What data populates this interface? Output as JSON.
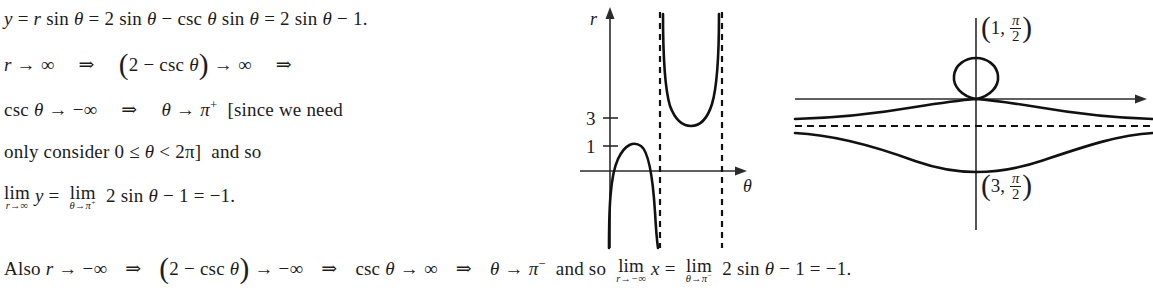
{
  "document": {
    "type": "math-solution",
    "background_color": "#ffffff",
    "text_color": "#1c1c1c"
  },
  "text_lines": [
    {
      "id": "line1",
      "content": "y = r sin θ = 2 sin θ − csc θ sin θ = 2 sin θ − 1.",
      "parts": {
        "y": "y",
        "eq1": "=",
        "r": "r",
        "sin1": "sin",
        "theta1": "θ",
        "eq2": "=",
        "two1": "2",
        "sin2": "sin",
        "theta2": "θ",
        "minus1": "−",
        "csc1": "csc",
        "theta3": "θ",
        "sin3": "sin",
        "theta4": "θ",
        "eq3": "=",
        "two2": "2",
        "sin4": "sin",
        "theta5": "θ",
        "minus2": "−",
        "one": "1."
      }
    },
    {
      "id": "line2",
      "content": "r → ∞ ⇒ (2 − csc θ) → ∞ ⇒",
      "parts": {
        "r": "r",
        "arrow1": "→",
        "inf1": "∞",
        "implies1": "⇒",
        "lparen": "(",
        "two": "2",
        "minus": "−",
        "csc": "csc",
        "theta": "θ",
        "rparen": ")",
        "arrow2": "→",
        "inf2": "∞",
        "implies2": "⇒"
      }
    },
    {
      "id": "line3",
      "content": "csc θ → −∞ ⇒ θ → π⁺ [since we need",
      "parts": {
        "csc": "csc",
        "theta1": "θ",
        "arrow1": "→",
        "neginf": "−∞",
        "implies": "⇒",
        "theta2": "θ",
        "arrow2": "→",
        "pi": "π",
        "plus": "+",
        "bracket_text": "[since we need"
      }
    },
    {
      "id": "line4",
      "content": "only consider 0 ≤ θ < 2π] and so",
      "parts": {
        "lead": "only consider 0",
        "leq": "≤",
        "theta": "θ",
        "lt": "<",
        "twopi": "2π]",
        "tail": "and so"
      }
    },
    {
      "id": "line5",
      "content": "lim (r→∞) y = lim (θ→π⁺) 2 sin θ − 1 = −1.",
      "parts": {
        "lim1_main": "lim",
        "lim1_sub": "r→∞",
        "y": "y",
        "eq1": "=",
        "lim2_main": "lim",
        "lim2_sub": "θ→π",
        "lim2_sub_sup": "+",
        "two": "2",
        "sin": "sin",
        "theta": "θ",
        "minus": "−",
        "one": "1",
        "eq2": "=",
        "result": "−1."
      }
    },
    {
      "id": "line6",
      "content": "Also r → −∞ ⇒ (2 − csc θ) → −∞ ⇒ csc θ → ∞ ⇒ θ → π⁻ and so lim (r→−∞) x = lim (θ→π⁻) 2 sin θ − 1 = −1.",
      "parts": {
        "also": "Also",
        "r": "r",
        "arrow1": "→",
        "neginf1": "−∞",
        "implies1": "⇒",
        "lparen": "(",
        "two1": "2",
        "minus1": "−",
        "csc1": "csc",
        "theta1": "θ",
        "rparen": ")",
        "arrow2": "→",
        "neginf2": "−∞",
        "implies2": "⇒",
        "csc2": "csc",
        "theta2": "θ",
        "arrow3": "→",
        "inf": "∞",
        "implies3": "⇒",
        "theta3": "θ",
        "arrow4": "→",
        "pi": "π",
        "minus_sup": "−",
        "andso": "and so",
        "lim1_main": "lim",
        "lim1_sub": "r→−∞",
        "x": "x",
        "eq1": "=",
        "lim2_main": "lim",
        "lim2_sub": "θ→π",
        "lim2_sub_sup": "−",
        "two2": "2",
        "sin": "sin",
        "theta4": "θ",
        "minus2": "−",
        "one": "1",
        "eq2": "=",
        "result": "−1."
      }
    }
  ],
  "figures": [
    {
      "id": "cartesian-plot",
      "name": "r-theta-cartesian-graph",
      "description": "Graph of r = 2 - csc(theta) in Cartesian r-theta coordinates with two vertical dashed asymptotes",
      "axis_labels": {
        "vertical": "r",
        "horizontal": "θ"
      },
      "tick_labels": [
        "3",
        "1"
      ],
      "tick_values": [
        3,
        1
      ],
      "asymptote_count": 2,
      "branches": [
        {
          "name": "left-arch",
          "peak_value": 1
        },
        {
          "name": "middle-u-branch",
          "min_value": 3
        }
      ]
    },
    {
      "id": "polar-conchoid",
      "name": "conchoid-polar-graph",
      "description": "Conchoid r = 2 - csc(theta) plotted in the plane: inner loop above origin, upper branch, lower branch, horizontal dashed asymptote",
      "point_labels": [
        {
          "text": "(1, π/2)",
          "r": "1",
          "theta": "π/2",
          "position": "upper"
        },
        {
          "text": "(3, π/2)",
          "r": "3",
          "theta": "π/2",
          "position": "lower"
        }
      ],
      "has_horizontal_asymptote": true,
      "has_inner_loop": true
    }
  ]
}
